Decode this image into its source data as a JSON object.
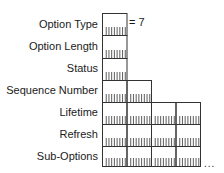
{
  "diagram": {
    "title": "",
    "fields": [
      {
        "label": "Option Type",
        "bytes": 1,
        "value": "= 7"
      },
      {
        "label": "Option Length",
        "bytes": 1
      },
      {
        "label": "Status",
        "bytes": 1
      },
      {
        "label": "Sequence Number",
        "bytes": 2
      },
      {
        "label": "Lifetime",
        "bytes": 4
      },
      {
        "label": "Refresh",
        "bytes": 4
      },
      {
        "label": "Sub-Options",
        "bytes": 4,
        "continues": true
      }
    ],
    "option_type_value": "= 7",
    "continuation": "...",
    "colors": {
      "line": "#333333",
      "background": "#ffffff"
    }
  }
}
